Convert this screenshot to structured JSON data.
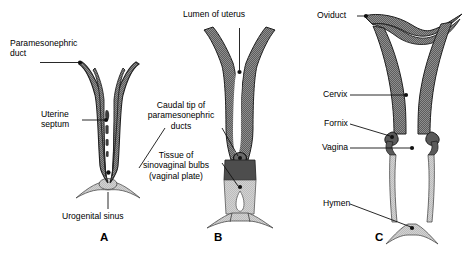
{
  "figure": {
    "domain": "anatomical-diagram",
    "colors": {
      "ink": "#1a1a1a",
      "dark_tissue": "#5f5f5f",
      "mid_tissue": "#6e6e6e",
      "light_tissue": "#c9c9c9",
      "pale_tissue": "#d8d8d8",
      "background": "#ffffff"
    }
  },
  "panels": [
    {
      "id": "A",
      "letter": "A",
      "labels": [
        {
          "key": "paramesonephric_duct",
          "text": "Paramesonephric\nduct"
        },
        {
          "key": "uterine_septum",
          "text": "Uterine\nseptum"
        },
        {
          "key": "urogenital_sinus",
          "text": "Urogenital sinus"
        }
      ]
    },
    {
      "id": "B",
      "letter": "B",
      "labels": [
        {
          "key": "lumen_of_uterus",
          "text": "Lumen of uterus"
        },
        {
          "key": "caudal_tip",
          "text": "Caudal tip of\nparamesonephric\nducts"
        },
        {
          "key": "sinovaginal_bulbs",
          "text": "Tissue of\nsinovaginal bulbs\n(vaginal plate)"
        }
      ]
    },
    {
      "id": "C",
      "letter": "C",
      "labels": [
        {
          "key": "oviduct",
          "text": "Oviduct"
        },
        {
          "key": "cervix",
          "text": "Cervix"
        },
        {
          "key": "fornix",
          "text": "Fornix"
        },
        {
          "key": "vagina",
          "text": "Vagina"
        },
        {
          "key": "hymen",
          "text": "Hymen"
        }
      ]
    }
  ],
  "annotations": {
    "paramesonephric_duct": "Paramesonephric\nduct",
    "uterine_septum": "Uterine\nseptum",
    "urogenital_sinus": "Urogenital sinus",
    "lumen_of_uterus": "Lumen of uterus",
    "caudal_tip": "Caudal tip of\nparamesonephric\nducts",
    "sinovaginal_bulbs": "Tissue of\nsinovaginal bulbs\n(vaginal plate)",
    "oviduct": "Oviduct",
    "cervix": "Cervix",
    "fornix": "Fornix",
    "vagina": "Vagina",
    "hymen": "Hymen",
    "letter_a": "A",
    "letter_b": "B",
    "letter_c": "C"
  }
}
